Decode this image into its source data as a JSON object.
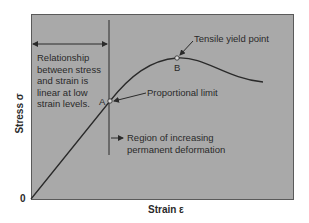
{
  "figure": {
    "type": "stress-strain diagram",
    "x_axis_label": "Strain ε",
    "y_axis_label": "Stress σ",
    "origin_label": "0",
    "annotations": {
      "linear_region": {
        "lines": [
          "Relationship",
          "between stress",
          "and strain is",
          "linear at low",
          "strain levels."
        ]
      },
      "tensile_yield_point": "Tensile yield point",
      "proportional_limit": "Proportional limit",
      "permanent_deformation": {
        "lines": [
          "Region of increasing",
          "permanent deformation"
        ]
      },
      "point_a": "A",
      "point_b": "B"
    },
    "colors": {
      "plot_background": "#a9a9a9",
      "line": "#2a2a2a",
      "text": "#2a2a2a"
    }
  }
}
